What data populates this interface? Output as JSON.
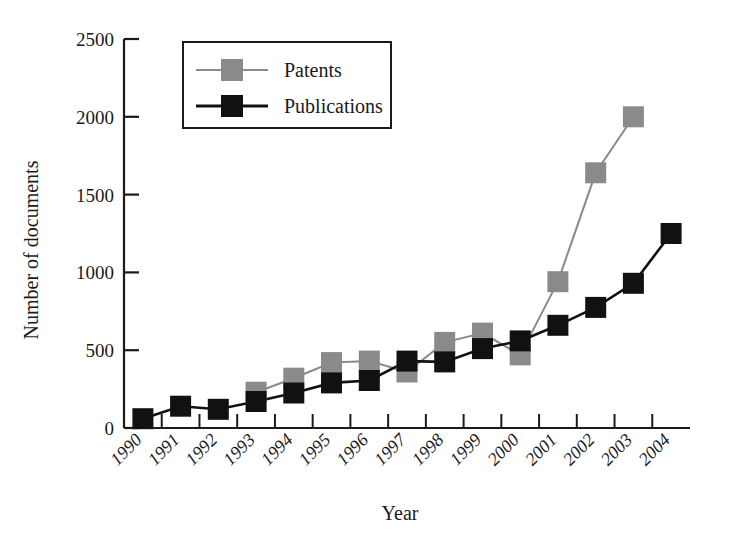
{
  "chart_data": {
    "type": "line",
    "title": "",
    "xlabel": "Year",
    "ylabel": "Number of documents",
    "categories": [
      "1990",
      "1991",
      "1992",
      "1993",
      "1994",
      "1995",
      "1996",
      "1997",
      "1998",
      "1999",
      "2000",
      "2001",
      "2002",
      "2003",
      "2004"
    ],
    "ylim": [
      0,
      2500
    ],
    "yticks": [
      0,
      500,
      1000,
      1500,
      2000,
      2500
    ],
    "ytick_labels": [
      "0",
      "500",
      "1000",
      "1500",
      "2000",
      "2500"
    ],
    "grid": false,
    "legend_position": "top-left-inside",
    "series": [
      {
        "name": "Patents",
        "color": "#8a8a8a",
        "marker": "square",
        "values": [
          null,
          null,
          null,
          230,
          320,
          420,
          430,
          360,
          550,
          610,
          470,
          940,
          1640,
          2000,
          null
        ]
      },
      {
        "name": "Publications",
        "color": "#111111",
        "marker": "square",
        "values": [
          60,
          140,
          120,
          170,
          225,
          290,
          305,
          430,
          425,
          510,
          560,
          660,
          775,
          930,
          1250
        ]
      }
    ]
  },
  "legend": {
    "entries": [
      {
        "label": "Patents",
        "color": "#8a8a8a"
      },
      {
        "label": "Publications",
        "color": "#111111"
      }
    ]
  },
  "axes": {
    "y_title": "Number of documents",
    "x_title": "Year"
  },
  "colors": {
    "patents": "#8a8a8a",
    "publications": "#111111",
    "axis": "#1a1a1a",
    "background": "#ffffff"
  }
}
